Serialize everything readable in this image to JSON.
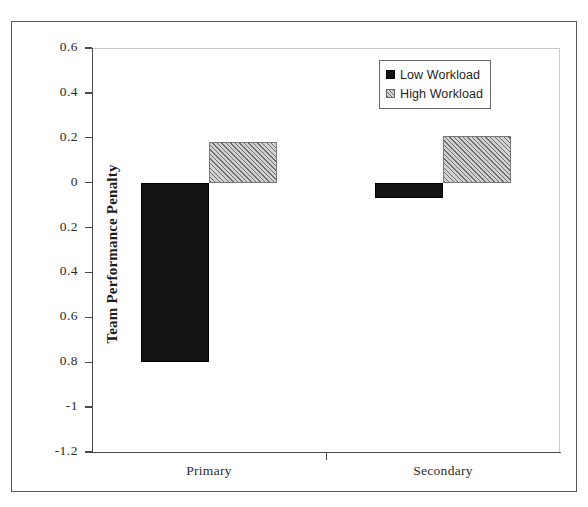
{
  "chart_data": {
    "type": "bar",
    "title": "",
    "xlabel": "",
    "ylabel": "Team Performance Penalty",
    "categories": [
      "Primary",
      "Secondary"
    ],
    "series": [
      {
        "name": "Low Workload",
        "values": [
          -0.8,
          -0.07
        ],
        "color": "#141414",
        "fill": "solid"
      },
      {
        "name": "High Workload",
        "values": [
          0.18,
          0.21
        ],
        "color": "#d2d2d2",
        "fill": "diagonal-hatch"
      }
    ],
    "ylim": [
      -1.2,
      0.6
    ],
    "ytick_values": [
      0.6,
      0.4,
      0.2,
      0,
      -0.2,
      -0.4,
      -0.6,
      -0.8,
      -1,
      -1.2
    ],
    "ytick_labels": [
      "0.6",
      "0.4",
      "0.2",
      "0",
      "0.2",
      "0.4",
      "0.6",
      "0.8",
      "-1",
      "-1.2"
    ],
    "grid": false,
    "legend_position": "top-right",
    "legend_entries": [
      "Low Workload",
      "High Workload"
    ]
  },
  "legend": {
    "items": [
      {
        "label": "Low Workload",
        "swatch": "solid-black-square-icon"
      },
      {
        "label": "High Workload",
        "swatch": "hatched-gray-square-icon"
      }
    ]
  },
  "axes": {
    "y_title": "Team Performance Penalty"
  }
}
